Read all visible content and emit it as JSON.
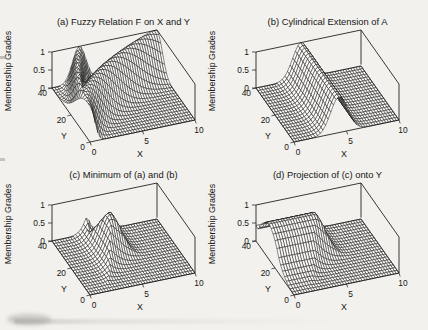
{
  "figure": {
    "kind": "scanned textbook figure: max-min composition of fuzzy relations",
    "background": "#f2f1ed",
    "ink": "#161616",
    "mesh_fill": "#fbfaf7"
  },
  "chart_data": [
    {
      "id": "a",
      "type": "surface",
      "title": "(a) Fuzzy Relation F on X and Y",
      "xlabel": "X",
      "ylabel": "Y",
      "zlabel": "Membership Grades",
      "x_range": [
        0,
        10
      ],
      "y_range": [
        0,
        40
      ],
      "z_range": [
        0,
        1
      ],
      "x_ticks": [
        0,
        5,
        10
      ],
      "y_ticks": [
        0,
        20,
        40
      ],
      "z_ticks": [
        0,
        0.5,
        1
      ],
      "grid_points": {
        "x": 41,
        "y": 21
      },
      "surface": {
        "fn": "fuzzy_relation",
        "ridge1": {
          "curve_coef": 2.6,
          "curve_pow": 1.7,
          "width_base": 0.35,
          "width_slope": 0.55
        },
        "ridge2": {
          "curve_coef": 10,
          "curve_pow": 2,
          "width_base": 0.6,
          "width_slope": 3.6
        },
        "description": "Membership ridges rise from a spike at the origin and fan toward the back of the X-Y plane, forming a high curved band (peak 1) with a saddle dip near x=6 at large y; the front-right region is 0."
      }
    },
    {
      "id": "b",
      "type": "surface",
      "title": "(b) Cylindrical Extension of A",
      "xlabel": "X",
      "ylabel": "Y",
      "zlabel": "Membership Grades",
      "x_range": [
        0,
        10
      ],
      "y_range": [
        0,
        40
      ],
      "z_range": [
        0,
        1
      ],
      "x_ticks": [
        0,
        5,
        10
      ],
      "y_ticks": [
        0,
        20,
        40
      ],
      "z_ticks": [
        0,
        0.5,
        1
      ],
      "grid_points": {
        "x": 41,
        "y": 21
      },
      "surface": {
        "fn": "cylindrical_extension",
        "set_A": {
          "center": 4.3,
          "width": 1.15
        },
        "description": "Gaussian fuzzy set A on X (center 4.3, width 1.15, peak 1) extended uniformly along Y as a constant ridge."
      }
    },
    {
      "id": "c",
      "type": "surface",
      "title": "(c) Minimum of (a) and (b)",
      "xlabel": "X",
      "ylabel": "Y",
      "zlabel": "Membership Grades",
      "x_range": [
        0,
        10
      ],
      "y_range": [
        0,
        40
      ],
      "z_range": [
        0,
        1
      ],
      "x_ticks": [
        0,
        5,
        10
      ],
      "y_ticks": [
        0,
        20,
        40
      ],
      "z_ticks": [
        0,
        0.5,
        1
      ],
      "grid_points": {
        "x": 41,
        "y": 21
      },
      "surface": {
        "fn": "minimum",
        "of": [
          "a",
          "b"
        ],
        "description": "Pointwise minimum of (a) and (b): an isolated bump with peak 1 centered near x=4.3, y=26; 0 elsewhere."
      }
    },
    {
      "id": "d",
      "type": "surface",
      "title": "(d) Projection of (c) onto Y",
      "xlabel": "X",
      "ylabel": "Y",
      "zlabel": "Membership Grades",
      "x_range": [
        0,
        10
      ],
      "y_range": [
        0,
        40
      ],
      "z_range": [
        0,
        1
      ],
      "x_ticks": [
        0,
        5,
        10
      ],
      "y_ticks": [
        0,
        20,
        40
      ],
      "z_ticks": [
        0,
        0.5,
        1
      ],
      "grid_points": {
        "x": 41,
        "y": 21
      },
      "surface": {
        "fn": "projection_onto_y",
        "of": "c",
        "description": "Shadow of the bump in (c) swept onto the Y-Z wall: running maximum along X, giving a plateau of height about 0.9-1 over y=20-35 for x below 4.5, dropping to 0 at front and back."
      }
    }
  ]
}
